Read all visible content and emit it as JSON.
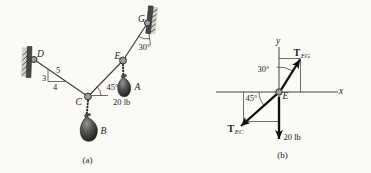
{
  "figure": {
    "panel_a": {
      "caption": "(a)",
      "points": {
        "D": "D",
        "G": "G",
        "E": "E",
        "C": "C",
        "A": "A",
        "B": "B"
      },
      "angle_at_g": "30°",
      "angle_at_c": "45°",
      "load_label": "20 lb",
      "slope_triangle": {
        "rise": "3",
        "run": "4",
        "hypotenuse": "5"
      }
    },
    "panel_b": {
      "caption": "(b)",
      "axes": {
        "x_label": "x",
        "y_label": "y"
      },
      "node_label": "E",
      "tension_eg": {
        "symbol": "T",
        "subscript": "EG"
      },
      "tension_ec": {
        "symbol": "T",
        "subscript": "EC"
      },
      "angle_from_y": "30°",
      "angle_from_x": "45°",
      "load_label": "20 lb"
    }
  },
  "colors": {
    "paper": "#fbfaf6",
    "ink": "#1c1c1c",
    "cable": "#3f3f3f",
    "force_arrow": "#101010",
    "wall": "#474747",
    "wall_shadow": "#b9b8b2",
    "weight_dark": "#1d1d1d",
    "weight_light": "#969696"
  }
}
